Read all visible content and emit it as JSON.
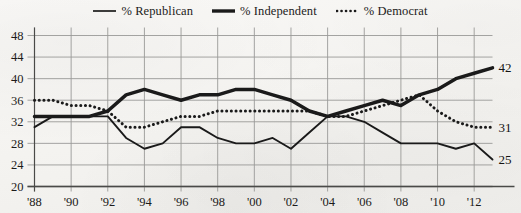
{
  "legend": {
    "position": "top-center",
    "entries": [
      {
        "label": "% Republican",
        "style": "thin-solid",
        "swatch_name": "legend-swatch-republican"
      },
      {
        "label": "% Independent",
        "style": "thick-solid",
        "swatch_name": "legend-swatch-independent"
      },
      {
        "label": "% Democrat",
        "style": "dotted",
        "swatch_name": "legend-swatch-democrat"
      }
    ]
  },
  "colors": {
    "line": "#1a1a1a",
    "grid": "#9a9a97",
    "axis": "#4a4a48",
    "background": "#f7f6f4",
    "text": "#1c1b1a"
  },
  "axes": {
    "y_ticks": [
      "20",
      "24",
      "28",
      "32",
      "36",
      "40",
      "44",
      "48"
    ],
    "x_ticks": [
      "'88",
      "'90",
      "'92",
      "'94",
      "'96",
      "'98",
      "'00",
      "'02",
      "'04",
      "'06",
      "'08",
      "'10",
      "'12"
    ]
  },
  "end_labels": [
    {
      "name": "end-label-independent",
      "value": "42"
    },
    {
      "name": "end-label-democrat",
      "value": "31"
    },
    {
      "name": "end-label-republican",
      "value": "25"
    }
  ],
  "chart_data": {
    "type": "line",
    "title": "",
    "xlabel": "",
    "ylabel": "",
    "xlim": [
      1988,
      2013
    ],
    "ylim": [
      20,
      48
    ],
    "y_ticks": [
      20,
      24,
      28,
      32,
      36,
      40,
      44,
      48
    ],
    "x_ticks": [
      1988,
      1990,
      1992,
      1994,
      1996,
      1998,
      2000,
      2002,
      2004,
      2006,
      2008,
      2010,
      2012
    ],
    "x_tick_labels": [
      "'88",
      "'90",
      "'92",
      "'94",
      "'96",
      "'98",
      "'00",
      "'02",
      "'04",
      "'06",
      "'08",
      "'10",
      "'12"
    ],
    "grid": true,
    "legend": "top-center",
    "x": [
      1988,
      1989,
      1990,
      1991,
      1992,
      1993,
      1994,
      1995,
      1996,
      1997,
      1998,
      1999,
      2000,
      2001,
      2002,
      2003,
      2004,
      2005,
      2006,
      2007,
      2008,
      2009,
      2010,
      2011,
      2012,
      2013
    ],
    "series": [
      {
        "name": "% Republican",
        "style": "thin-solid",
        "end_value": 25,
        "values": [
          31,
          33,
          33,
          33,
          33,
          29,
          27,
          28,
          31,
          31,
          29,
          28,
          28,
          29,
          27,
          30,
          33,
          33,
          32,
          30,
          28,
          28,
          28,
          27,
          28,
          25
        ]
      },
      {
        "name": "% Independent",
        "style": "thick-solid",
        "end_value": 42,
        "values": [
          33,
          33,
          33,
          33,
          34,
          37,
          38,
          37,
          36,
          37,
          37,
          38,
          38,
          37,
          36,
          34,
          33,
          34,
          35,
          36,
          35,
          37,
          38,
          40,
          41,
          42
        ]
      },
      {
        "name": "% Democrat",
        "style": "dotted",
        "end_value": 31,
        "values": [
          36,
          36,
          35,
          35,
          34,
          31,
          31,
          32,
          33,
          33,
          34,
          34,
          34,
          34,
          34,
          34,
          33,
          33,
          34,
          35,
          36,
          37,
          34,
          32,
          31,
          31
        ]
      }
    ]
  }
}
